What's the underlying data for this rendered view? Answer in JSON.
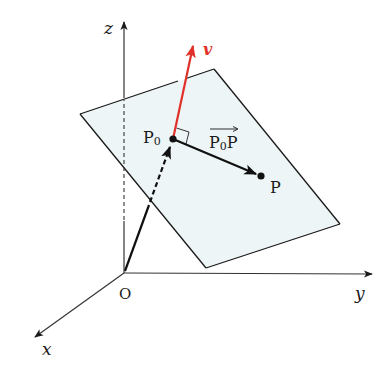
{
  "diagram": {
    "colors": {
      "plane_fill": "#eef5f6",
      "stroke": "#1a1a1a",
      "normal_vector": "#e0312a",
      "axis": "#333333"
    },
    "labels": {
      "z_axis": "z",
      "y_axis": "y",
      "x_axis": "x",
      "origin": "O",
      "p0_main": "P",
      "p0_sub": "0",
      "p": "P",
      "normal": "v",
      "vec_main_1": "P",
      "vec_sub": "0",
      "vec_main_2": "P"
    },
    "points": {
      "origin": [
        124,
        273
      ],
      "P0": [
        173,
        139
      ],
      "P": [
        261,
        176
      ],
      "v_tip": [
        193,
        46
      ]
    },
    "plane_corners": [
      [
        80,
        114
      ],
      [
        214,
        69
      ],
      [
        340,
        224
      ],
      [
        206,
        268
      ]
    ],
    "axes": {
      "z_end": [
        124,
        22
      ],
      "y_end": [
        372,
        274
      ],
      "x_end": [
        34,
        338
      ]
    }
  }
}
